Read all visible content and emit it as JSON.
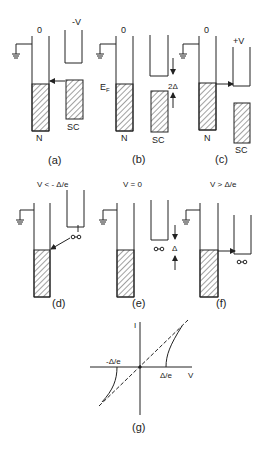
{
  "panels": {
    "a": {
      "caption": "(a)",
      "voltage": "-V",
      "zero": "0",
      "n_label": "N",
      "sc_label": "SC"
    },
    "b": {
      "caption": "(b)",
      "zero": "0",
      "ef_label": "E",
      "ef_sub": "F",
      "gap_label": "2Δ",
      "n_label": "N",
      "sc_label": "SC"
    },
    "c": {
      "caption": "(c)",
      "voltage": "+V",
      "zero": "0",
      "n_label": "N",
      "sc_label": "SC"
    },
    "d": {
      "caption": "(d)",
      "condition": "V < - Δ/e"
    },
    "e": {
      "caption": "(e)",
      "condition": "V = 0",
      "gap_label": "Δ"
    },
    "f": {
      "caption": "(f)",
      "condition": "V > Δ/e"
    },
    "g": {
      "caption": "(g)",
      "y_axis": "I",
      "x_axis": "V",
      "neg_gap": "-Δ/e",
      "pos_gap": "Δ/e"
    }
  },
  "colors": {
    "line": "#222222",
    "hatch": "#444444",
    "dashed": "#333333"
  }
}
